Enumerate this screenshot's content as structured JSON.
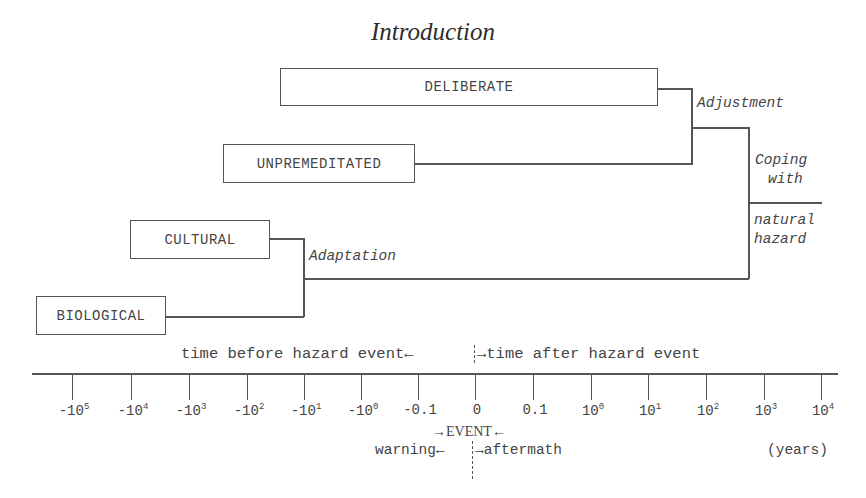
{
  "header": {
    "title": "Introduction"
  },
  "boxes": {
    "deliberate": "DELIBERATE",
    "unpremeditated": "UNPREMEDITATED",
    "cultural": "CULTURAL",
    "biological": "BIOLOGICAL"
  },
  "labels": {
    "adjustment": "Adjustment",
    "adaptation": "Adaptation",
    "coping_line1": "Coping",
    "coping_line2": "with",
    "hazard_line1": "natural",
    "hazard_line2": "hazard"
  },
  "timeline": {
    "before_label": "time before hazard event←",
    "after_label": "→time after hazard event",
    "ticks": [
      {
        "base": "-10",
        "exp": "5"
      },
      {
        "base": "-10",
        "exp": "4"
      },
      {
        "base": "-10",
        "exp": "3"
      },
      {
        "base": "-10",
        "exp": "2"
      },
      {
        "base": "-10",
        "exp": "1"
      },
      {
        "base": "-10",
        "exp": "0"
      },
      {
        "base": "-0.1",
        "exp": ""
      },
      {
        "base": "0",
        "exp": ""
      },
      {
        "base": "0.1",
        "exp": ""
      },
      {
        "base": "10",
        "exp": "0"
      },
      {
        "base": "10",
        "exp": "1"
      },
      {
        "base": "10",
        "exp": "2"
      },
      {
        "base": "10",
        "exp": "3"
      },
      {
        "base": "10",
        "exp": "4"
      }
    ],
    "event_label": "→EVENT←",
    "warning_label": "warning←",
    "aftermath_label": "→aftermath",
    "units": "(years)"
  }
}
